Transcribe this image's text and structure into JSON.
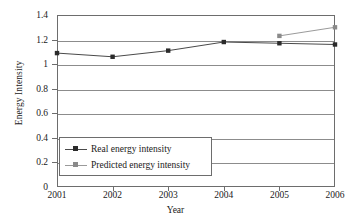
{
  "chart_data": {
    "type": "line",
    "title": "",
    "xlabel": "Year",
    "ylabel": "Energy Intensity",
    "categories": [
      "2001",
      "2002",
      "2003",
      "2004",
      "2005",
      "2006"
    ],
    "x": [
      2001,
      2002,
      2003,
      2004,
      2005,
      2006
    ],
    "xlim": [
      2001,
      2006
    ],
    "ylim": [
      0,
      1.4
    ],
    "y_ticks": [
      "0",
      "0.2",
      "0.4",
      "0.6",
      "0.8",
      "1",
      "1.2",
      "1.4"
    ],
    "y_tick_values": [
      0,
      0.2,
      0.4,
      0.6,
      0.8,
      1.0,
      1.2,
      1.4
    ],
    "grid": true,
    "legend_position": "lower left",
    "series": [
      {
        "name": "Real energy intensity",
        "color": "#4a4a4a",
        "marker_color": "#2b2b2b",
        "x": [
          2001,
          2002,
          2003,
          2004,
          2005,
          2006
        ],
        "values": [
          1.09,
          1.06,
          1.11,
          1.18,
          1.17,
          1.16
        ]
      },
      {
        "name": "Predicted energy intensity",
        "color": "#9a9a9a",
        "marker_color": "#8a8a8a",
        "x": [
          2005,
          2006
        ],
        "values": [
          1.23,
          1.3
        ]
      }
    ]
  },
  "legend": {
    "items": [
      {
        "label": "Real energy intensity"
      },
      {
        "label": "Predicted energy intensity"
      }
    ]
  },
  "axes": {
    "x_title": "Year",
    "y_title": "Energy Intensity"
  }
}
